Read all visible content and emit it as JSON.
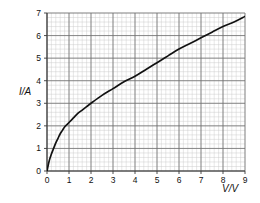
{
  "chart_data": {
    "type": "line",
    "title": "",
    "subtitle": "",
    "xlabel": "V/V",
    "ylabel": "I/A",
    "xlim": [
      0,
      9
    ],
    "ylim": [
      0,
      7
    ],
    "grid": true,
    "grid_major_step_x": 1,
    "grid_major_step_y": 1,
    "grid_minor_divisions": 5,
    "legend": "none",
    "x_ticks": [
      "0",
      "1",
      "2",
      "3",
      "4",
      "5",
      "6",
      "7",
      "8",
      "9"
    ],
    "y_ticks": [
      "0",
      "1",
      "2",
      "3",
      "4",
      "5",
      "6",
      "7"
    ],
    "series": [
      {
        "name": "I-V characteristic",
        "color": "#111111",
        "x": [
          0,
          0.1,
          0.2,
          0.3,
          0.4,
          0.5,
          0.6,
          0.7,
          0.8,
          0.9,
          1.0,
          1.2,
          1.4,
          1.6,
          1.8,
          2.0,
          2.5,
          3.0,
          3.5,
          4.0,
          4.5,
          5.0,
          5.5,
          6.0,
          6.5,
          7.0,
          7.5,
          8.0,
          8.5,
          9.0
        ],
        "y": [
          0.0,
          0.45,
          0.75,
          1.0,
          1.25,
          1.45,
          1.65,
          1.8,
          1.95,
          2.05,
          2.15,
          2.35,
          2.55,
          2.7,
          2.85,
          3.0,
          3.35,
          3.65,
          3.95,
          4.2,
          4.5,
          4.8,
          5.1,
          5.4,
          5.65,
          5.9,
          6.15,
          6.4,
          6.6,
          6.85
        ]
      }
    ],
    "colors": {
      "curve": "#111111",
      "grid_minor": "#c9c9c9",
      "grid_major": "#6e6e6e",
      "axis": "#3a3a3a",
      "background": "#ffffff",
      "text": "#111111"
    }
  },
  "labels": {
    "y_axis_title": "I/A",
    "x_axis_title": "V/V"
  }
}
